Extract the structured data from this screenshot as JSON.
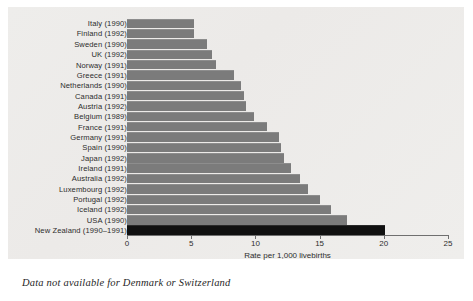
{
  "figure": {
    "caption": "Data not available for Denmark or Switzerland",
    "panel_bg": "#ececea",
    "bar_color": "#7b7b7b",
    "highlight_color": "#101010"
  },
  "chart_data": {
    "type": "bar",
    "orientation": "horizontal",
    "title": "",
    "xlabel": "Rate per 1,000 livebirths",
    "ylabel": "",
    "xlim": [
      0,
      25
    ],
    "xticks": [
      0,
      5,
      10,
      15,
      20,
      25
    ],
    "xtick_labels": [
      "0",
      "5",
      "10",
      "15",
      "20",
      "25"
    ],
    "grid": false,
    "legend": null,
    "highlight_category": "New Zealand (1990–1991)",
    "categories": [
      "Italy (1990)",
      "Finland (1992)",
      "Sweden (1990)",
      "UK (1992)",
      "Norway (1991)",
      "Greece (1991)",
      "Netherlands (1990)",
      "Canada (1991)",
      "Austria (1992)",
      "Belgium (1989)",
      "France (1991)",
      "Germany (1991)",
      "Spain (1990)",
      "Japan (1992)",
      "Ireland (1991)",
      "Australia (1992)",
      "Luxembourg (1992)",
      "Portugal (1992)",
      "Iceland (1992)",
      "USA (1990)",
      "New Zealand (1990–1991)"
    ],
    "values": [
      5.2,
      5.2,
      6.2,
      6.6,
      6.9,
      8.3,
      8.9,
      9.1,
      9.3,
      9.9,
      10.9,
      11.8,
      12.0,
      12.2,
      12.8,
      13.5,
      14.1,
      15.0,
      15.9,
      17.1,
      20.1
    ]
  }
}
